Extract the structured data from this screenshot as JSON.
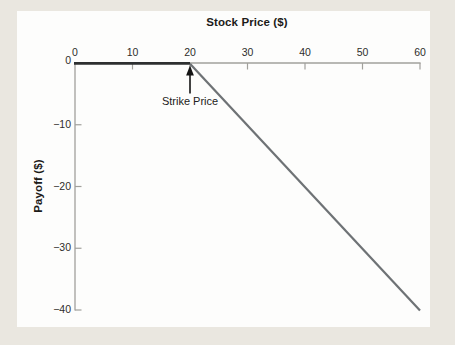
{
  "page": {
    "background_color": "#eae7e0",
    "panel_color": "#fdfdfc"
  },
  "chart_data": {
    "type": "line",
    "title": "",
    "xlabel": "Stock Price ($)",
    "ylabel": "Payoff ($)",
    "xlim": [
      0,
      60
    ],
    "ylim": [
      -40,
      0
    ],
    "x_axis_position": "top",
    "y_axis_position": "left",
    "grid": false,
    "legend": false,
    "x_ticks": [
      0,
      10,
      20,
      30,
      40,
      50,
      60
    ],
    "x_tick_labels": [
      "0",
      "10",
      "20",
      "30",
      "40",
      "50",
      "60"
    ],
    "y_ticks": [
      0,
      -10,
      -20,
      -30,
      -40
    ],
    "y_tick_labels": [
      "0",
      "−10",
      "−20",
      "−30",
      "−40"
    ],
    "series": [
      {
        "name": "payoff",
        "x": [
          0,
          20,
          60
        ],
        "y": [
          0,
          0,
          -40
        ]
      }
    ],
    "annotation": {
      "text": "Strike Price",
      "x": 20,
      "y": 0,
      "arrow": "up"
    },
    "colors": {
      "axis": "#a1a09c",
      "tick_label": "#2e2d2b",
      "line_flat": "#2d2f30",
      "line_slope": "#6e7275",
      "arrow": "#141414"
    }
  }
}
